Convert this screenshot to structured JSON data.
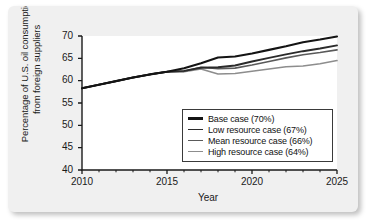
{
  "chart_data": {
    "type": "line",
    "title": "",
    "xlabel": "Year",
    "ylabel": "Percentage of U.S. oil consumption from foreign suppliers",
    "ylabel_line1": "Percentage of U.S. oil consumption",
    "ylabel_line2": "from foreign suppliers",
    "xlim": [
      2010,
      2025
    ],
    "ylim": [
      40,
      70
    ],
    "grid": false,
    "legend_position": "lower-right",
    "x_ticks": [
      2010,
      2015,
      2020,
      2025
    ],
    "x_tick_labels": [
      "2010",
      "2015",
      "2020",
      "2025"
    ],
    "x_minor_ticks": [
      2011,
      2012,
      2013,
      2014,
      2016,
      2017,
      2018,
      2019,
      2021,
      2022,
      2023,
      2024
    ],
    "y_ticks": [
      40,
      45,
      50,
      55,
      60,
      65,
      70
    ],
    "y_tick_labels": [
      "40",
      "45",
      "50",
      "55",
      "60",
      "65",
      "70"
    ],
    "x": [
      2010,
      2011,
      2012,
      2013,
      2014,
      2015,
      2016,
      2017,
      2018,
      2019,
      2020,
      2021,
      2022,
      2023,
      2024,
      2025
    ],
    "series": [
      {
        "name": "Base case (70%)",
        "label": "Base case (70%)",
        "color": "#141414",
        "width": 2.1,
        "end_value": 70,
        "values": [
          58.3,
          59.1,
          59.9,
          60.7,
          61.4,
          62.0,
          62.8,
          63.9,
          65.2,
          65.4,
          66.1,
          66.9,
          67.7,
          68.6,
          69.2,
          69.9
        ]
      },
      {
        "name": "Low resource case (67%)",
        "label": "Low resource case (67%)",
        "color": "#2b2b2b",
        "width": 1.9,
        "end_value": 67,
        "values": [
          58.3,
          59.1,
          59.9,
          60.7,
          61.4,
          62.0,
          62.2,
          62.9,
          63.0,
          63.4,
          64.3,
          65.1,
          65.9,
          66.6,
          67.2,
          67.9
        ]
      },
      {
        "name": "Mean resource case (66%)",
        "label": "Mean resource case (66%)",
        "color": "#5a5a5a",
        "width": 1.7,
        "end_value": 66,
        "values": [
          58.3,
          59.1,
          59.9,
          60.7,
          61.4,
          62.0,
          62.1,
          63.0,
          62.7,
          62.8,
          63.5,
          64.3,
          65.1,
          65.8,
          66.3,
          66.9
        ]
      },
      {
        "name": "High resource case (64%)",
        "label": "High resource case (64%)",
        "color": "#8d8d8d",
        "width": 1.6,
        "end_value": 64,
        "values": [
          58.3,
          59.1,
          59.9,
          60.7,
          61.4,
          62.0,
          62.0,
          62.6,
          61.5,
          61.6,
          62.1,
          62.6,
          63.1,
          63.3,
          63.8,
          64.5
        ]
      }
    ]
  }
}
